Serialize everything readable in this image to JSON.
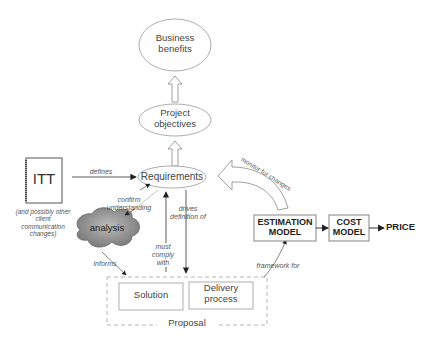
{
  "diagram": {
    "nodes": {
      "business_benefits": "Business benefits",
      "project_objectives": "Project objectives",
      "requirements": "Requirements",
      "itt": "ITT",
      "itt_note": "(and possibly other client communication changes)",
      "analysis": "analysis",
      "solution": "Solution",
      "delivery_process": "Delivery process",
      "proposal": "Proposal",
      "estimation_model": "ESTIMATION MODEL",
      "cost_model": "COST MODEL",
      "price": "PRICE"
    },
    "edges": {
      "defines": "defines",
      "confirm_understanding": "confirm understanding",
      "drives_definition_of": "drives definition of",
      "must_comply_with": "must comply with",
      "informs": "informs",
      "framework_for": "framework for",
      "monitor_for_changes": "monitor for changes"
    }
  }
}
